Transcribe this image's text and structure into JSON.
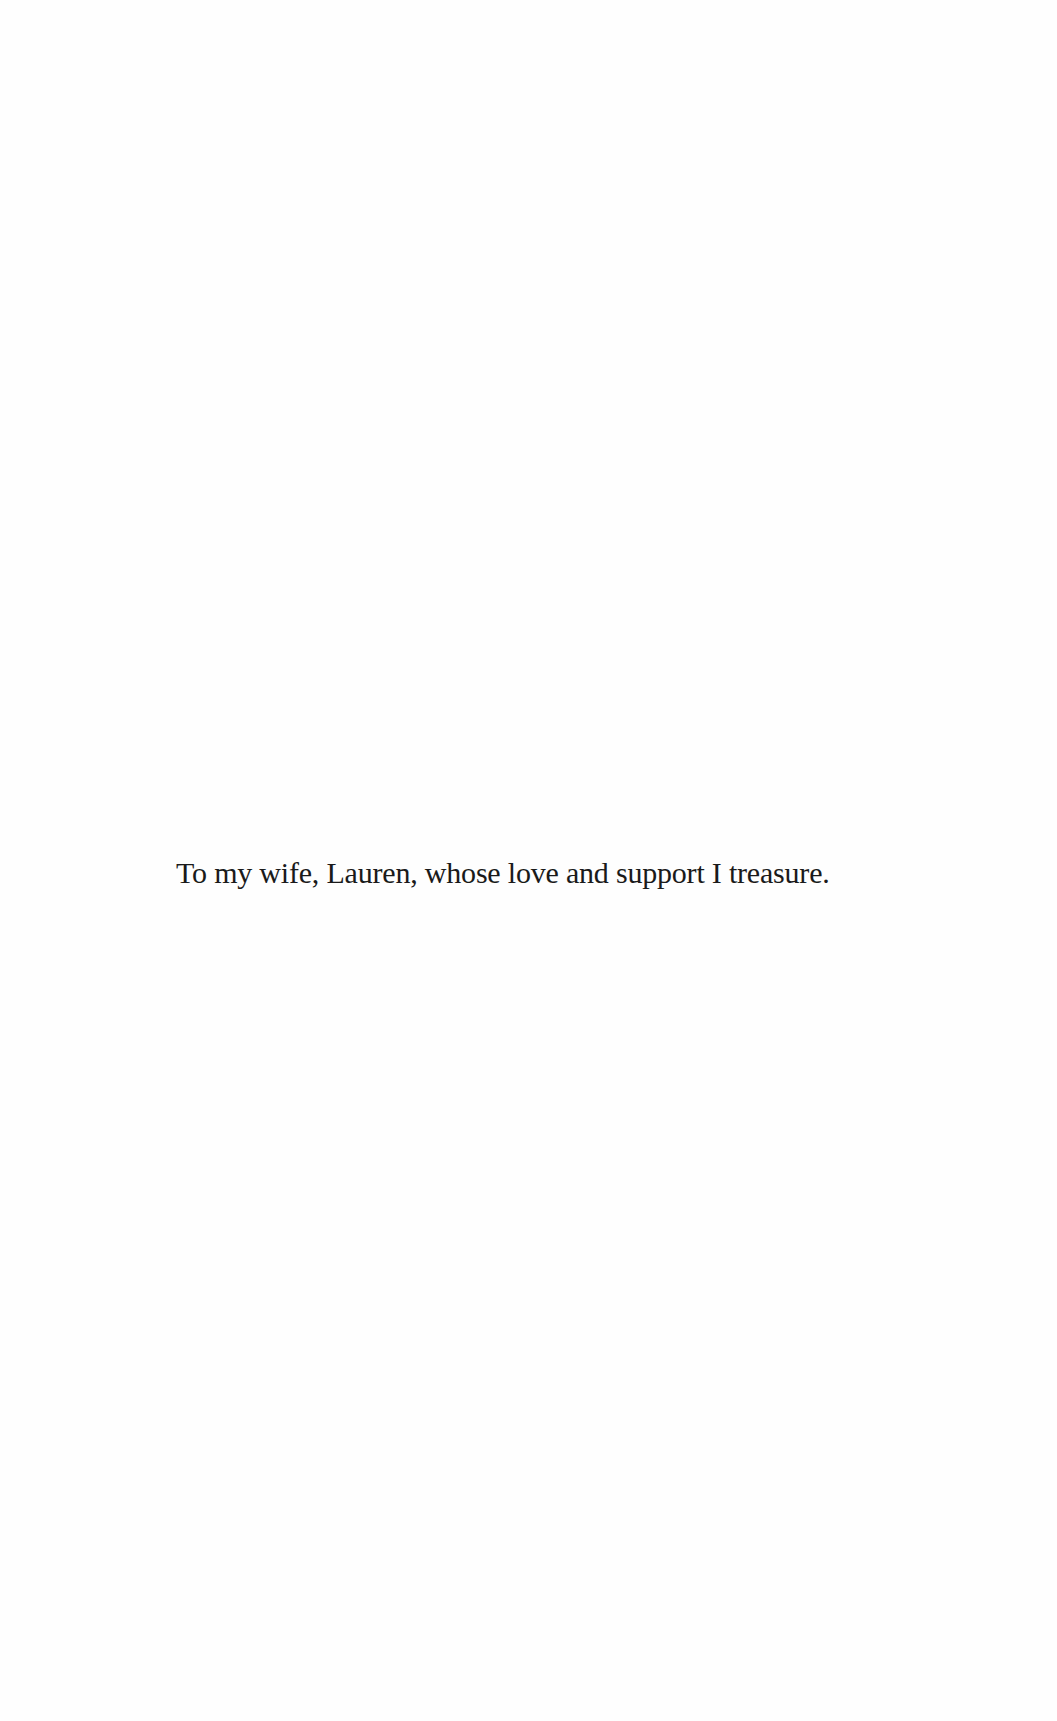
{
  "page": {
    "type": "dedication",
    "background_color": "#ffffff",
    "text_color": "#1a1a1a"
  },
  "dedication": {
    "text": "To my wife, Lauren, whose love and support I treasure."
  }
}
